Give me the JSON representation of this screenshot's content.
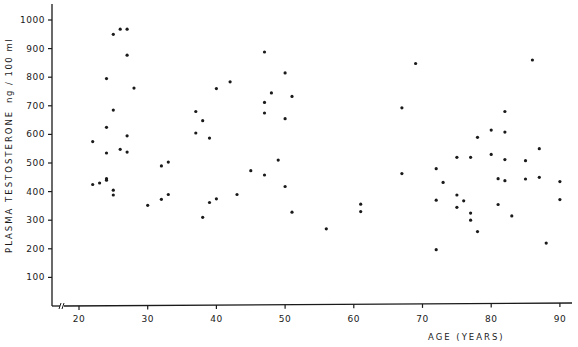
{
  "chart_data": {
    "type": "scatter",
    "title": "",
    "xlabel": "AGE (YEARS)",
    "ylabel": "PLASMA TESTOSTERONE",
    "y_unit": "ng / 100 ml",
    "xlim": [
      15,
      92
    ],
    "ylim": [
      0,
      1050
    ],
    "x_ticks": [
      20,
      30,
      40,
      50,
      60,
      70,
      80,
      90
    ],
    "y_ticks": [
      100,
      200,
      300,
      400,
      500,
      600,
      700,
      800,
      900,
      1000
    ],
    "grid": false,
    "legend": null,
    "x_axis_break": true,
    "series": [
      {
        "name": "subjects",
        "points": [
          {
            "x": 25,
            "y": 950
          },
          {
            "x": 26,
            "y": 968
          },
          {
            "x": 27,
            "y": 968
          },
          {
            "x": 27,
            "y": 877
          },
          {
            "x": 24,
            "y": 795
          },
          {
            "x": 28,
            "y": 762
          },
          {
            "x": 25,
            "y": 685
          },
          {
            "x": 24,
            "y": 625
          },
          {
            "x": 27,
            "y": 595
          },
          {
            "x": 22,
            "y": 575
          },
          {
            "x": 26,
            "y": 548
          },
          {
            "x": 27,
            "y": 538
          },
          {
            "x": 24,
            "y": 535
          },
          {
            "x": 32,
            "y": 490
          },
          {
            "x": 33,
            "y": 503
          },
          {
            "x": 22,
            "y": 425
          },
          {
            "x": 23,
            "y": 430
          },
          {
            "x": 24,
            "y": 445
          },
          {
            "x": 24,
            "y": 440
          },
          {
            "x": 25,
            "y": 405
          },
          {
            "x": 25,
            "y": 388
          },
          {
            "x": 30,
            "y": 352
          },
          {
            "x": 32,
            "y": 373
          },
          {
            "x": 33,
            "y": 390
          },
          {
            "x": 47,
            "y": 888
          },
          {
            "x": 50,
            "y": 815
          },
          {
            "x": 42,
            "y": 784
          },
          {
            "x": 40,
            "y": 760
          },
          {
            "x": 48,
            "y": 745
          },
          {
            "x": 51,
            "y": 733
          },
          {
            "x": 47,
            "y": 712
          },
          {
            "x": 47,
            "y": 675
          },
          {
            "x": 37,
            "y": 680
          },
          {
            "x": 38,
            "y": 648
          },
          {
            "x": 50,
            "y": 655
          },
          {
            "x": 37,
            "y": 605
          },
          {
            "x": 39,
            "y": 587
          },
          {
            "x": 49,
            "y": 510
          },
          {
            "x": 45,
            "y": 473
          },
          {
            "x": 47,
            "y": 458
          },
          {
            "x": 50,
            "y": 418
          },
          {
            "x": 43,
            "y": 390
          },
          {
            "x": 40,
            "y": 375
          },
          {
            "x": 39,
            "y": 362
          },
          {
            "x": 51,
            "y": 328
          },
          {
            "x": 38,
            "y": 310
          },
          {
            "x": 56,
            "y": 270
          },
          {
            "x": 61,
            "y": 356
          },
          {
            "x": 61,
            "y": 330
          },
          {
            "x": 67,
            "y": 693
          },
          {
            "x": 67,
            "y": 463
          },
          {
            "x": 69,
            "y": 848
          },
          {
            "x": 72,
            "y": 480
          },
          {
            "x": 73,
            "y": 432
          },
          {
            "x": 72,
            "y": 370
          },
          {
            "x": 72,
            "y": 197
          },
          {
            "x": 75,
            "y": 520
          },
          {
            "x": 75,
            "y": 388
          },
          {
            "x": 75,
            "y": 345
          },
          {
            "x": 76,
            "y": 368
          },
          {
            "x": 77,
            "y": 520
          },
          {
            "x": 77,
            "y": 325
          },
          {
            "x": 77,
            "y": 300
          },
          {
            "x": 78,
            "y": 590
          },
          {
            "x": 78,
            "y": 260
          },
          {
            "x": 80,
            "y": 615
          },
          {
            "x": 80,
            "y": 530
          },
          {
            "x": 81,
            "y": 445
          },
          {
            "x": 81,
            "y": 355
          },
          {
            "x": 82,
            "y": 680
          },
          {
            "x": 82,
            "y": 608
          },
          {
            "x": 82,
            "y": 512
          },
          {
            "x": 82,
            "y": 438
          },
          {
            "x": 83,
            "y": 315
          },
          {
            "x": 85,
            "y": 508
          },
          {
            "x": 85,
            "y": 444
          },
          {
            "x": 86,
            "y": 860
          },
          {
            "x": 87,
            "y": 550
          },
          {
            "x": 87,
            "y": 450
          },
          {
            "x": 88,
            "y": 220
          },
          {
            "x": 90,
            "y": 435
          },
          {
            "x": 90,
            "y": 372
          }
        ]
      }
    ]
  },
  "colors": {
    "ink": "#1a1a1a",
    "background": "#ffffff"
  }
}
